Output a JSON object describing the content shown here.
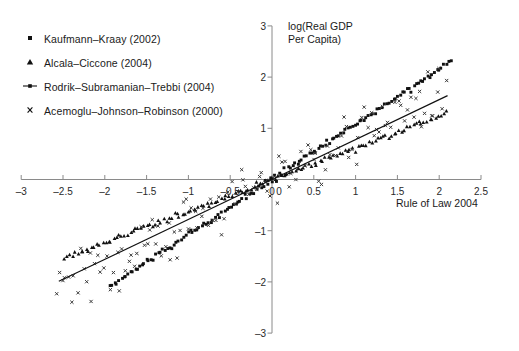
{
  "chart_data": {
    "type": "scatter",
    "title": "",
    "xlabel": "Rule of Law 2004",
    "ylabel": "log(Real GDP Per Capita)",
    "ylabel_line1": "log(Real GDP",
    "ylabel_line2": "Per Capita)",
    "xlim": [
      -3,
      2.5
    ],
    "ylim": [
      -3,
      3
    ],
    "xticks": [
      "-3",
      "-2.5",
      "-2",
      "-1.5",
      "-1",
      "-0.5",
      "0",
      "0.5",
      "1",
      "1.5",
      "2",
      "2.5"
    ],
    "xtick_values": [
      -3,
      -2.5,
      -2,
      -1.5,
      -1,
      -0.5,
      0,
      0.5,
      1,
      1.5,
      2,
      2.5
    ],
    "yticks": [
      "3",
      "2",
      "1",
      "0",
      "-1",
      "-2",
      "-3"
    ],
    "ytick_values": [
      3,
      2,
      1,
      0,
      -1,
      -2,
      -3
    ],
    "grid": false,
    "legend_position": "top-left",
    "axes_style": "crossed-at-origin",
    "legend": [
      {
        "label": "Kaufmann–Kraay (2002)",
        "marker": "square",
        "color": "#111111"
      },
      {
        "label": "Alcala–Ciccone (2004)",
        "marker": "triangle",
        "color": "#111111"
      },
      {
        "label": "Rodrik–Subramanian–Trebbi (2004)",
        "marker": "line-with-dot",
        "color": "#111111"
      },
      {
        "label": "Acemoglu–Johnson–Robinson (2000)",
        "marker": "x",
        "color": "#111111"
      }
    ],
    "series": [
      {
        "name": "Kaufmann–Kraay (2002)",
        "marker": "square",
        "color": "#111111",
        "description": "Dense near-linear band, slope ~1.08, passing through origin, spanning x from -1.95 to 2.15",
        "fit": {
          "slope": 1.08,
          "intercept": 0.0,
          "x_from": -1.95,
          "x_to": 2.15
        },
        "jitter": 0.055,
        "n": 150
      },
      {
        "name": "Alcala–Ciccone (2004)",
        "marker": "triangle",
        "color": "#111111",
        "description": "Dense near-linear band, slope ~0.62, passing through origin, spanning x from -2.5 to 2.1",
        "fit": {
          "slope": 0.62,
          "intercept": 0.0,
          "x_from": -2.5,
          "x_to": 2.1
        },
        "jitter": 0.05,
        "n": 140
      },
      {
        "name": "Rodrik–Subramanian–Trebbi (2004)",
        "marker": "line-with-dot",
        "color": "#111111",
        "description": "Solid regression line, slope ~0.78, through origin, drawn from x=-2.55 to x=2.1",
        "fit": {
          "slope": 0.78,
          "intercept": 0.0,
          "x_from": -2.55,
          "x_to": 2.1
        },
        "is_line": true
      },
      {
        "name": "Acemoglu–Johnson–Robinson (2000)",
        "marker": "x",
        "color": "#444444",
        "description": "Widely dispersed cross markers, positive trend slope ~0.85 with large scatter (sd ~0.55)",
        "fit": {
          "slope": 0.85,
          "intercept": 0.0,
          "x_from": -2.6,
          "x_to": 2.1
        },
        "scatter_sd": 0.55,
        "n": 130
      }
    ]
  }
}
